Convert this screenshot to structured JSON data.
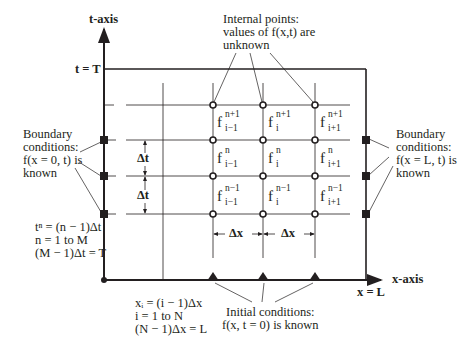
{
  "diagram": {
    "axes": {
      "t_axis_label": "t-axis",
      "x_axis_label": "x-axis",
      "t_end_label": "t = T",
      "x_end_label": "x = L"
    },
    "annotations": {
      "internal_points": [
        "Internal points:",
        "values of f(x,t) are",
        "unknown"
      ],
      "left_boundary": [
        "Boundary",
        "conditions:",
        "f(x = 0, t) is",
        "known"
      ],
      "right_boundary": [
        "Boundary",
        "conditions:",
        "f(x = L, t) is",
        "known"
      ],
      "time_discretization": [
        "tⁿ = (n − 1)Δt",
        "n = 1 to M",
        "(M − 1)Δt = T"
      ],
      "space_discretization": [
        "xᵢ = (i − 1)Δx",
        "i = 1 to N",
        "(N − 1)Δx = L"
      ],
      "initial_conditions": [
        "Initial conditions:",
        "f(x, t = 0) is known"
      ]
    },
    "step_labels": {
      "dt_upper": "Δt",
      "dt_lower": "Δt",
      "dx_left": "Δx",
      "dx_right": "Δx"
    },
    "grid_nodes": [
      {
        "row": 0,
        "col": 0,
        "base": "f",
        "sup": "n+1",
        "sub": "i−1"
      },
      {
        "row": 0,
        "col": 1,
        "base": "f",
        "sup": "n+1",
        "sub": "i"
      },
      {
        "row": 0,
        "col": 2,
        "base": "f",
        "sup": "n+1",
        "sub": "i+1"
      },
      {
        "row": 1,
        "col": 0,
        "base": "f",
        "sup": "n",
        "sub": "i−1"
      },
      {
        "row": 1,
        "col": 1,
        "base": "f",
        "sup": "n",
        "sub": "i"
      },
      {
        "row": 1,
        "col": 2,
        "base": "f",
        "sup": "n",
        "sub": "i+1"
      },
      {
        "row": 2,
        "col": 0,
        "base": "f",
        "sup": "n−1",
        "sub": "i−1"
      },
      {
        "row": 2,
        "col": 1,
        "base": "f",
        "sup": "n−1",
        "sub": "i"
      },
      {
        "row": 2,
        "col": 2,
        "base": "f",
        "sup": "n−1",
        "sub": "i+1"
      }
    ],
    "legend_markers": {
      "internal_point": "open-circle",
      "boundary_point": "filled-square",
      "initial_point": "filled-triangle"
    }
  }
}
